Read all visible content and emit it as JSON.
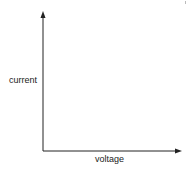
{
  "diagram": {
    "type": "axes",
    "y_axis": {
      "label": "current",
      "direction": "up",
      "arrow": true
    },
    "x_axis": {
      "label": "voltage",
      "direction": "right",
      "arrow": true
    },
    "line_color": "#222222",
    "plotted_series": []
  }
}
